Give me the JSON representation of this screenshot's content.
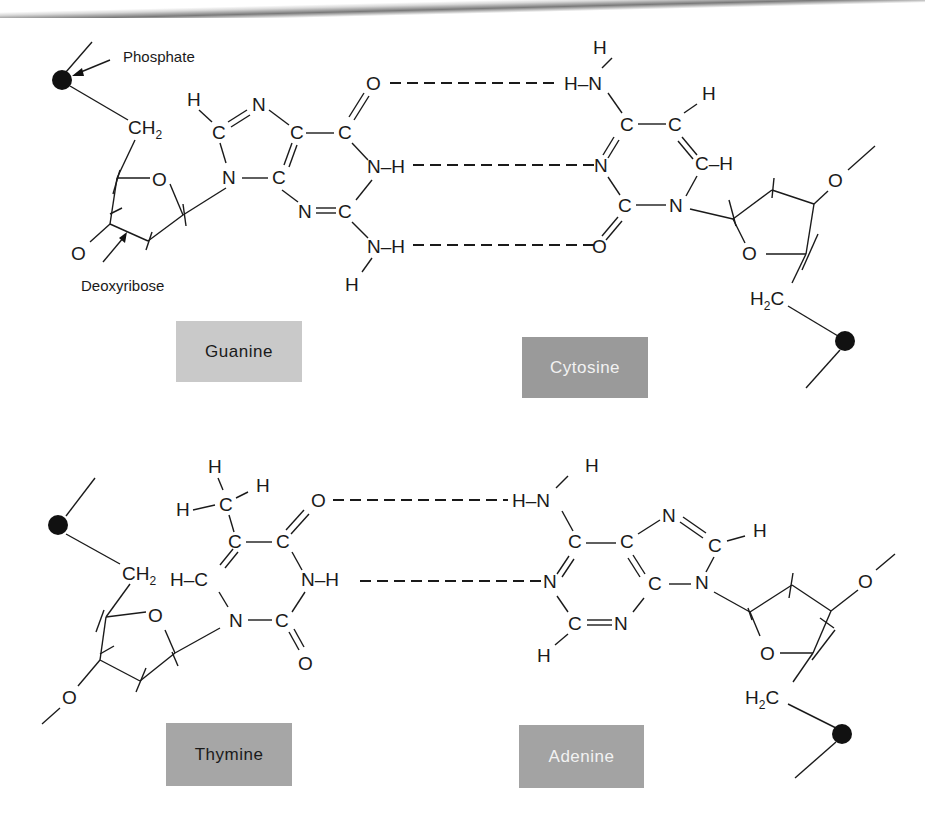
{
  "figure": {
    "type": "DNA base pairing diagram",
    "annotations": {
      "phosphate": "Phosphate",
      "deoxyribose": "Deoxyribose"
    },
    "colors": {
      "box_light": "#c9c9c9",
      "box_dark": "#9a9a9a",
      "box_mid": "#a6a6a6",
      "ink": "#1a1a1a"
    }
  },
  "pairs": [
    {
      "name": "G-C pair",
      "left_base": {
        "label": "Guanine"
      },
      "right_base": {
        "label": "Cytosine"
      },
      "hydrogen_bonds": 3
    },
    {
      "name": "T-A pair",
      "left_base": {
        "label": "Thymine"
      },
      "right_base": {
        "label": "Adenine"
      },
      "hydrogen_bonds": 2
    }
  ],
  "atoms": {
    "H": "H",
    "C": "C",
    "N": "N",
    "O": "O",
    "CH2": "CH",
    "H2C_H": "H",
    "sub2": "2",
    "H2C_C": "C",
    "NH": "N–H",
    "HN": "H–N",
    "CH": "C–H",
    "HC": "H–C"
  }
}
